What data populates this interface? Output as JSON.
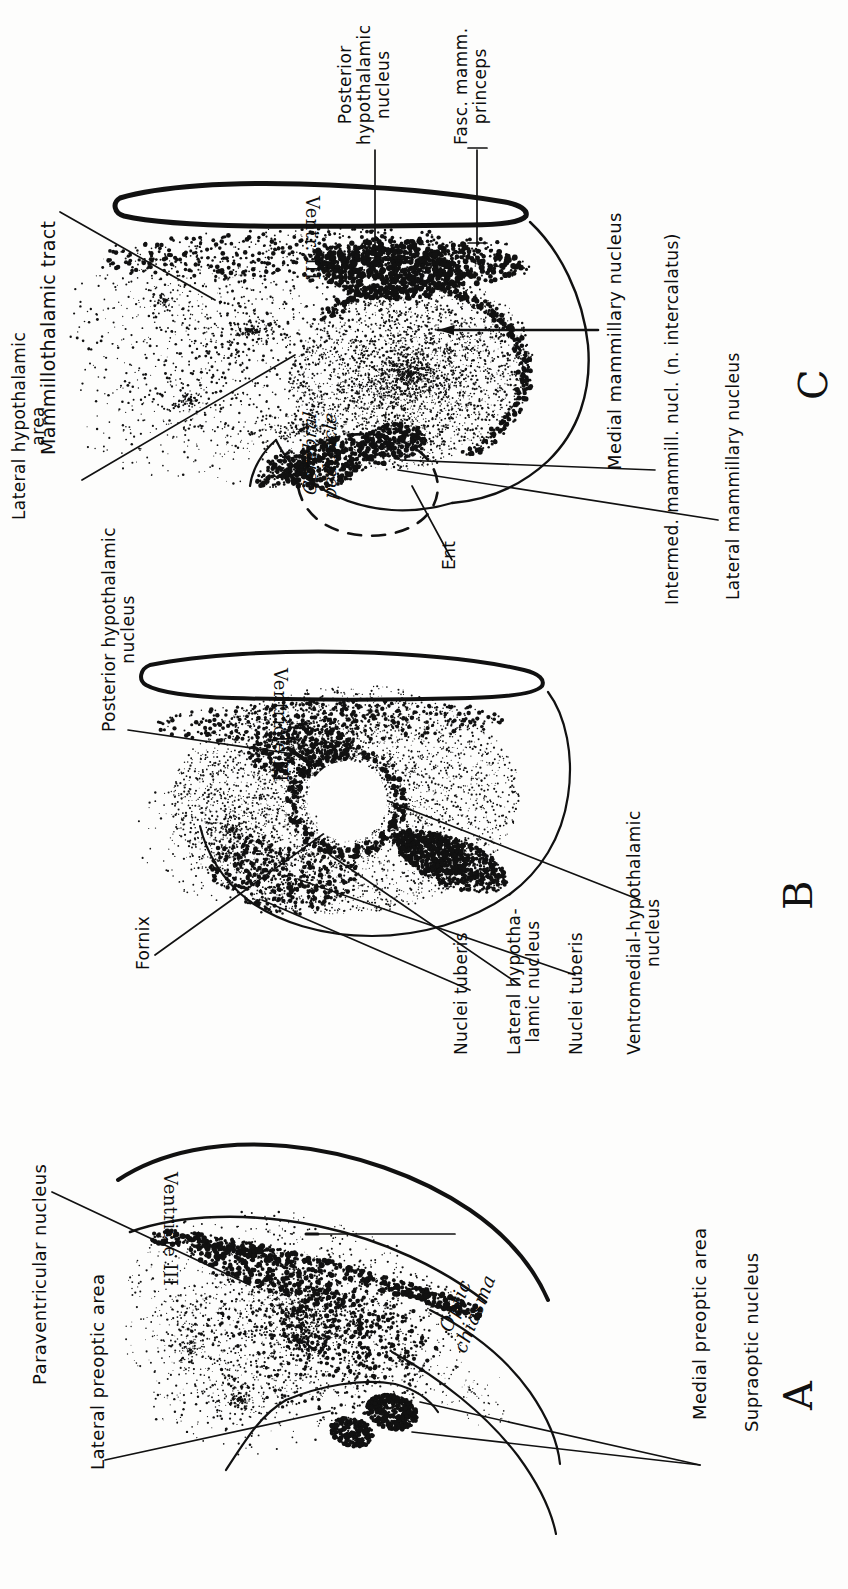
{
  "figure": {
    "orientation": "sideways (labels rotated 90 degrees counter-clockwise)",
    "background_color": "#fdfdfc",
    "ink_color": "#111111"
  },
  "panels": [
    {
      "letter": "C",
      "name": "mammillary-level-section",
      "ventricle_label": "Ventr. III",
      "labels": [
        {
          "id": "mammillothalamic-tract",
          "text": "Mammillothalamic tract",
          "leader": true
        },
        {
          "id": "lateral-hypothalamic-area",
          "text": "Lateral hypothalamic\narea",
          "leader": true
        },
        {
          "id": "posterior-hypothalamic-nucleus",
          "text": "Posterior\nhypothalamic\nnucleus",
          "leader": true
        },
        {
          "id": "fasc-mamm-princeps",
          "text": "Fasc. mamm.\nprinceps",
          "leader": true
        },
        {
          "id": "cerebral-peduncle",
          "text": "Cerebral\npeduncle",
          "leader": false
        },
        {
          "id": "ent",
          "text": "Ent",
          "leader": true
        },
        {
          "id": "medial-mammillary-nucleus",
          "text": "Medial mammillary nucleus",
          "leader": true
        },
        {
          "id": "intermed-mammill-nucl",
          "text": "Intermed. mammill. nucl. (n. intercalatus)",
          "leader": true
        },
        {
          "id": "lateral-mammillary-nucleus",
          "text": "Lateral mammillary nucleus",
          "leader": true
        }
      ]
    },
    {
      "letter": "B",
      "name": "tuberal-level-section",
      "ventricle_label": "Ventricle III",
      "labels": [
        {
          "id": "posterior-hypothalamic-nucleus-b",
          "text": "Posterior hypothalamic\nnucleus",
          "leader": true
        },
        {
          "id": "fornix",
          "text": "Fornix",
          "leader": true
        },
        {
          "id": "nuclei-tuberis-1",
          "text": "Nuclei tuberis",
          "leader": true
        },
        {
          "id": "lateral-hypothalamic-nucleus",
          "text": "Lateral hypotha-\nlamic nucleus",
          "leader": true
        },
        {
          "id": "nuclei-tuberis-2",
          "text": "Nuclei tuberis",
          "leader": true
        },
        {
          "id": "ventromedial-hypothalamic-nucleus",
          "text": "Ventromedial-hypothalamic\nnucleus",
          "leader": true
        }
      ]
    },
    {
      "letter": "A",
      "name": "preoptic-chiasmatic-level-section",
      "ventricle_label": "Ventricle III",
      "labels": [
        {
          "id": "paraventricular-nucleus",
          "text": "Paraventricular nucleus",
          "leader": true
        },
        {
          "id": "lateral-preoptic-area",
          "text": "Lateral preoptic area",
          "leader": true
        },
        {
          "id": "optic-chiasma",
          "text": "Optic\nchiasma",
          "leader": false
        },
        {
          "id": "medial-preoptic-area",
          "text": "Medial preoptic area",
          "leader": true
        },
        {
          "id": "supraoptic-nucleus",
          "text": "Supraoptic nucleus",
          "leader": true
        }
      ]
    }
  ]
}
